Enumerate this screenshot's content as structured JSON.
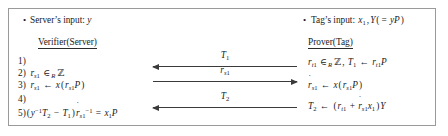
{
  "figure": {
    "type": "protocol-diagram",
    "border_color": "#9a9a9a",
    "background_color": "#ffffff",
    "text_color": "#1a1a1a",
    "arrow_color": "#3a3a3a"
  },
  "header": {
    "left_bullet": {
      "bullet": "•",
      "text": "Server’s input: y"
    },
    "right_bullet": {
      "bullet": "•",
      "text": "Tag’s input: x₁,Y(= yP)"
    }
  },
  "roles": {
    "verifier": "Verifier(Server)",
    "prover": "Prover(Tag)"
  },
  "verifier_steps": [
    {
      "num": "1)",
      "formula": ""
    },
    {
      "num": "2)",
      "formula": "rₛ₁ ∈ᵣ ℤ"
    },
    {
      "num": "3)",
      "formula": "ṙₛ₁ ← x(rₛ₁P)"
    },
    {
      "num": "4)",
      "formula": ""
    },
    {
      "num": "5)",
      "formula": "(y⁻¹T₂ − T₁)ṙₛ₁⁻¹ = x₁P"
    }
  ],
  "prover_steps": [
    {
      "formula": "rₜ₁ ∈ᵣ ℤ, T₁ ← rₜ₁P"
    },
    {
      "formula": "ṙₛ₁ ← x(rₛ₁P)"
    },
    {
      "formula": "T₂ ← (rₜ₁ + ṙₛ₁x₁)Y"
    }
  ],
  "messages": [
    {
      "label": "T₁",
      "direction": "left",
      "order": 1
    },
    {
      "label": "rₛ₁",
      "direction": "right",
      "order": 2
    },
    {
      "label": "T₂",
      "direction": "left",
      "order": 3
    }
  ]
}
